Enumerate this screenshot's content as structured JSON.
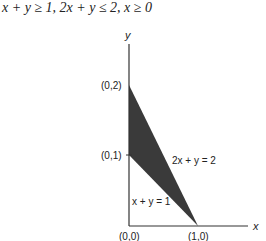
{
  "title": "x + y ≥ 1, 2x + y ≤ 2, x ≥ 0",
  "axes": {
    "x_label": "x",
    "y_label": "y"
  },
  "points": {
    "p02": "(0,2)",
    "p01": "(0,1)",
    "p00": "(0,0)",
    "p10": "(1,0)"
  },
  "lines": {
    "line1": "2x + y = 2",
    "line2": "x + y = 1"
  },
  "colors": {
    "region": "#3a3a3a",
    "axis": "#333333"
  }
}
